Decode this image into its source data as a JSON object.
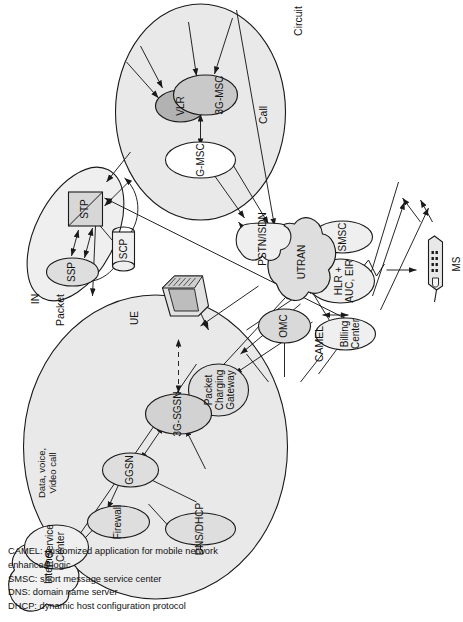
{
  "figure": {
    "domains": [
      {
        "id": "packet",
        "label": "Packet",
        "sublabel": "Data, voice,\nVideo call"
      },
      {
        "id": "in",
        "label": "IN"
      },
      {
        "id": "circuit",
        "label": "Circuit",
        "sublabel": "Call"
      }
    ],
    "edge_labels": [
      {
        "id": "camel",
        "text": "CAMEL"
      },
      {
        "id": "ue",
        "text": "UE"
      }
    ],
    "nodes": [
      {
        "id": "internet",
        "label": "Internet",
        "shape": "cloud"
      },
      {
        "id": "omc",
        "label": "OMC",
        "shape": "ellipse-filled"
      },
      {
        "id": "firewall",
        "label": "Firewall",
        "shape": "ellipse-filled"
      },
      {
        "id": "dns-dhcp",
        "label": "DNS/DHCP",
        "shape": "ellipse-filled"
      },
      {
        "id": "ggsn",
        "label": "GGSN",
        "shape": "ellipse-filled"
      },
      {
        "id": "ip-service-center",
        "label": "IP Service\nCenter",
        "shape": "ellipse"
      },
      {
        "id": "packet-charging-gateway",
        "label": "Packet\nCharging\nGateway",
        "shape": "ellipse-filled"
      },
      {
        "id": "3g-sgsn",
        "label": "3G-SGSN",
        "shape": "ellipse-filled"
      },
      {
        "id": "ssp",
        "label": "SSP",
        "shape": "ellipse-filled"
      },
      {
        "id": "stp",
        "label": "STP",
        "shape": "box-diagonal"
      },
      {
        "id": "scp",
        "label": "SCP",
        "shape": "cylinder"
      },
      {
        "id": "billing-center",
        "label": "Billing\nCenter",
        "shape": "ellipse"
      },
      {
        "id": "hlr-auc-eir",
        "label": "HLR +\nAUC, EIR",
        "shape": "ellipse"
      },
      {
        "id": "smsc",
        "label": "SMSC",
        "shape": "ellipse"
      },
      {
        "id": "utran",
        "label": "UTRAN",
        "shape": "cloud-filled"
      },
      {
        "id": "g-msc",
        "label": "G-MSC",
        "shape": "ellipse-white"
      },
      {
        "id": "vlr",
        "label": "VLR",
        "shape": "ellipse-dark"
      },
      {
        "id": "3g-msc",
        "label": "3G-MSC",
        "shape": "ellipse-filled"
      },
      {
        "id": "pstn-isdn",
        "label": "PSTN/ISDN",
        "shape": "cloud"
      },
      {
        "id": "ue-terminal",
        "label": "UE",
        "shape": "computer"
      },
      {
        "id": "ms",
        "label": "MS",
        "shape": "mobile-phone"
      }
    ],
    "legend": [
      "CAMEL: customized application for mobile network enhanced logic",
      "SMSC: short message service center",
      "DNS: domain name server",
      "DHCP: dynamic host configuration protocol"
    ],
    "colors": {
      "fill_light": "#e9e9e9",
      "fill_node": "#d9d9d9",
      "fill_dark": "#b4b4b4",
      "stroke": "#1a1a1a",
      "text": "#111111"
    }
  }
}
